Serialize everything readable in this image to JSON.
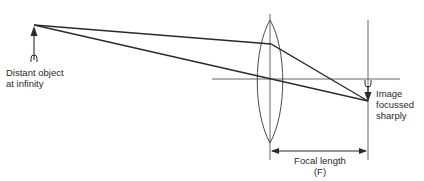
{
  "diagram": {
    "type": "optics-ray-diagram",
    "colors": {
      "line": "#2a2a2a",
      "lens": "#4a4a4a",
      "axis": "#555555",
      "background": "#ffffff"
    },
    "object": {
      "label_line1": "Distant object",
      "label_line2": "at infinity"
    },
    "image": {
      "label_line1": "Image",
      "label_line2": "focussed",
      "label_line3": "sharply"
    },
    "focal_length": {
      "label_line1": "Focal length",
      "label_line2": "(F)"
    }
  }
}
